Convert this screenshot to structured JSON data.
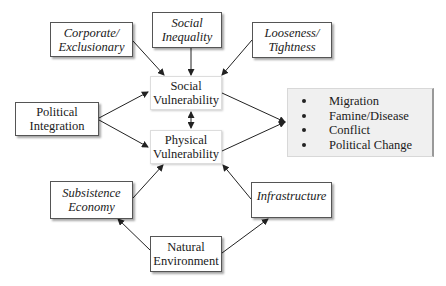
{
  "diagram": {
    "nodes": {
      "corporate": {
        "line1": "Corporate/",
        "line2": "Exclusionary",
        "style": "italic"
      },
      "inequality": {
        "line1": "Social",
        "line2": "Inequality",
        "style": "italic"
      },
      "looseness": {
        "line1": "Looseness/",
        "line2": "Tightness",
        "style": "italic"
      },
      "social_vuln": {
        "line1": "Social",
        "line2": "Vulnerability",
        "style": "normal"
      },
      "political": {
        "line1": "Political",
        "line2": "Integration",
        "style": "normal"
      },
      "physical_vuln": {
        "line1": "Physical",
        "line2": "Vulnerability",
        "style": "normal"
      },
      "subsistence": {
        "line1": "Subsistence",
        "line2": "Economy",
        "style": "italic"
      },
      "infrastructure": {
        "line1": "Infrastructure",
        "style": "italic"
      },
      "natural": {
        "line1": "Natural",
        "line2": "Environment",
        "style": "normal"
      }
    },
    "outcomes": {
      "items": [
        "Migration",
        "Famine/Disease",
        "Conflict",
        "Political Change"
      ]
    },
    "edges": [
      {
        "from": "corporate",
        "to": "social_vuln"
      },
      {
        "from": "inequality",
        "to": "social_vuln"
      },
      {
        "from": "looseness",
        "to": "social_vuln"
      },
      {
        "from": "political",
        "to": "social_vuln"
      },
      {
        "from": "political",
        "to": "physical_vuln"
      },
      {
        "from": "social_vuln",
        "to": "physical_vuln",
        "bidirectional": true
      },
      {
        "from": "social_vuln",
        "to": "outcomes"
      },
      {
        "from": "physical_vuln",
        "to": "outcomes"
      },
      {
        "from": "subsistence",
        "to": "physical_vuln"
      },
      {
        "from": "infrastructure",
        "to": "physical_vuln"
      },
      {
        "from": "natural",
        "to": "subsistence"
      },
      {
        "from": "natural",
        "to": "infrastructure"
      }
    ]
  }
}
